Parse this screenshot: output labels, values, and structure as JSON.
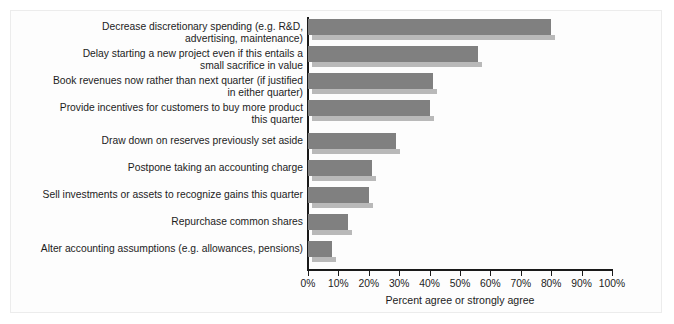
{
  "chart_data": {
    "type": "bar",
    "orientation": "horizontal",
    "title": "",
    "xlabel": "Percent agree or strongly agree",
    "ylabel": "",
    "xlim": [
      0,
      100
    ],
    "grid": false,
    "legend": null,
    "tick_labels": [
      "0%",
      "10%",
      "20%",
      "30%",
      "40%",
      "50%",
      "60%",
      "70%",
      "80%",
      "90%",
      "100%"
    ],
    "tick_values": [
      0,
      10,
      20,
      30,
      40,
      50,
      60,
      70,
      80,
      90,
      100
    ],
    "bar_color": "#808080",
    "bar_shadow_color": "#b9b9b9",
    "categories": [
      "Decrease discretionary spending (e.g. R&D,\nadvertising, maintenance)",
      "Delay starting a new project even if this entails a\nsmall sacrifice in value",
      "Book revenues now rather than next quarter (if justified\nin either quarter)",
      "Provide incentives for customers to buy more product\nthis quarter",
      "Draw down on reserves previously set aside",
      "Postpone taking an accounting charge",
      "Sell investments or assets to recognize gains this quarter",
      "Repurchase common shares",
      "Alter accounting assumptions (e.g. allowances, pensions)"
    ],
    "values": [
      80,
      56,
      41,
      40,
      29,
      21,
      20,
      13,
      8
    ]
  }
}
